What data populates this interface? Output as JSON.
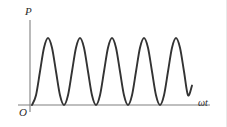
{
  "figure": {
    "kind": "line-plot",
    "width": 227,
    "height": 127,
    "background_color": "#ffffff"
  },
  "labels": {
    "y_axis": "P",
    "origin": "O",
    "x_axis": "ωt"
  },
  "colors": {
    "curve": "#333333",
    "axis": "#808080",
    "text": "#2b2b2b",
    "border": "#e9e9e9"
  },
  "chart_data": {
    "type": "line",
    "title": "",
    "xlabel": "ωt",
    "ylabel": "P",
    "grid": false,
    "legend": "none",
    "xlim": [
      0,
      5.5
    ],
    "ylim": [
      0,
      1.15
    ],
    "x_tick_labels": [],
    "y_tick_labels": [],
    "axis_arrows": false,
    "series": [
      {
        "name": "P(ωt)",
        "formula": "P = Pmax * sin^2(π * ωt)",
        "periods_shown": 5,
        "period_units": 1,
        "amplitude": 1,
        "baseline": 0,
        "start_x": 0,
        "end_x": 5.0,
        "end_y": 0.29,
        "zero_crossings_x": [
          0,
          1,
          2,
          3,
          4
        ],
        "peaks_x": [
          0.5,
          1.5,
          2.5,
          3.5,
          4.5
        ],
        "peaks_y": [
          1,
          1,
          1,
          1,
          1
        ],
        "x": [
          0,
          0.125,
          0.25,
          0.375,
          0.5,
          0.625,
          0.75,
          0.875,
          1,
          1.125,
          1.25,
          1.375,
          1.5,
          1.625,
          1.75,
          1.875,
          2,
          2.125,
          2.25,
          2.375,
          2.5,
          2.625,
          2.75,
          2.875,
          3,
          3.125,
          3.25,
          3.375,
          3.5,
          3.625,
          3.75,
          3.875,
          4,
          4.125,
          4.25,
          4.375,
          4.5,
          4.625,
          4.75,
          4.875,
          5
        ],
        "values": [
          0,
          0.146,
          0.5,
          0.854,
          1,
          0.854,
          0.5,
          0.146,
          0,
          0.146,
          0.5,
          0.854,
          1,
          0.854,
          0.5,
          0.146,
          0,
          0.146,
          0.5,
          0.854,
          1,
          0.854,
          0.5,
          0.146,
          0,
          0.146,
          0.5,
          0.854,
          1,
          0.854,
          0.5,
          0.146,
          0,
          0.146,
          0.5,
          0.854,
          1,
          0.854,
          0.5,
          0.146,
          0.29
        ]
      }
    ]
  },
  "geometry": {
    "y_axis_x": 30,
    "y_axis_top": 20,
    "y_axis_bottom": 112,
    "x_axis_y": 105,
    "x_axis_left": 18,
    "x_axis_right": 210,
    "curve_peak_y": 38,
    "curve_start_x": 32,
    "curve_end_x": 190,
    "curve_end_y": 78,
    "half_period_px": 32
  }
}
